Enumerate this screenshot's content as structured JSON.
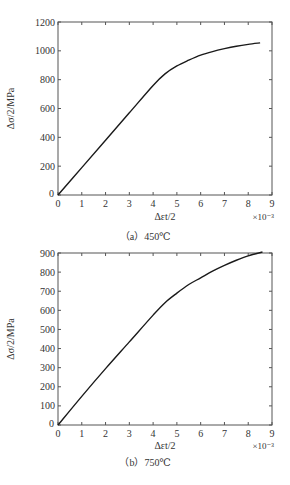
{
  "chart_data": [
    {
      "type": "line",
      "title": "",
      "caption": "（a）450℃",
      "xlabel": "Δεt/2",
      "ylabel": "Δσ/2/MPa",
      "x_multiplier": "×10⁻³",
      "xlim": [
        0,
        9
      ],
      "ylim": [
        0,
        1200
      ],
      "xticks": [
        0,
        1,
        2,
        3,
        4,
        5,
        6,
        7,
        8,
        9
      ],
      "yticks": [
        0,
        200,
        400,
        600,
        800,
        1000,
        1200
      ],
      "grid": false,
      "series": [
        {
          "name": "450℃",
          "x": [
            0,
            1,
            2,
            3,
            4,
            4.5,
            5,
            5.5,
            6,
            6.5,
            7,
            7.5,
            8,
            8.5
          ],
          "y": [
            0,
            190,
            380,
            570,
            760,
            840,
            895,
            935,
            970,
            995,
            1015,
            1032,
            1045,
            1055
          ]
        }
      ]
    },
    {
      "type": "line",
      "title": "",
      "caption": "（b）750℃",
      "xlabel": "Δεt/2",
      "ylabel": "Δσ/2/MPa",
      "x_multiplier": "×10⁻³",
      "xlim": [
        0,
        9
      ],
      "ylim": [
        0,
        900
      ],
      "xticks": [
        0,
        1,
        2,
        3,
        4,
        5,
        6,
        7,
        8,
        9
      ],
      "yticks": [
        0,
        100,
        200,
        300,
        400,
        500,
        600,
        700,
        800,
        900
      ],
      "grid": false,
      "series": [
        {
          "name": "750℃",
          "x": [
            0,
            1,
            2,
            3,
            4,
            4.5,
            5,
            5.5,
            6,
            6.5,
            7,
            7.5,
            8,
            8.6
          ],
          "y": [
            0,
            150,
            295,
            435,
            575,
            640,
            690,
            735,
            770,
            805,
            835,
            862,
            885,
            905
          ]
        }
      ]
    }
  ],
  "charts": [
    {
      "caption": "（a）450℃",
      "xlabel": "Δεt/2",
      "ylabel": "Δσ/2/MPa",
      "multiplier": "×10⁻³"
    },
    {
      "caption": "（b）750℃",
      "xlabel": "Δεt/2",
      "ylabel": "Δσ/2/MPa",
      "multiplier": "×10⁻³"
    }
  ]
}
